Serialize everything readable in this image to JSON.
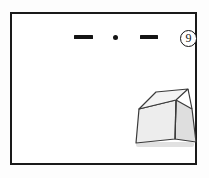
{
  "figure": {
    "domain": "scanned-line-drawing",
    "caption_number": "9",
    "badge_icon": "circled-number-icon",
    "frame": {
      "name": "drawing-border",
      "stroke_color": "#1a1a1a",
      "fill_color": "#ffffff",
      "x": 10,
      "y": 12,
      "width": 187,
      "height": 153
    },
    "background_color": "#ffffff"
  },
  "top_marks": {
    "label": "top-marking-row",
    "items": [
      {
        "name": "dash-mark-left",
        "type": "dash",
        "color": "#141414",
        "x": 62,
        "y": 21,
        "width": 19,
        "height": 4
      },
      {
        "name": "dot-mark-center",
        "type": "dot",
        "color": "#141414",
        "x": 101,
        "y": 21,
        "width": 5,
        "height": 5
      },
      {
        "name": "dash-mark-right",
        "type": "dash",
        "color": "#141414",
        "x": 128,
        "y": 21,
        "width": 18,
        "height": 4
      }
    ]
  },
  "solid": {
    "name": "frustum-truncated-pyramid",
    "description": "tapered box / truncated pyramid drawn in oblique projection",
    "outline_color": "#3a3a3a",
    "faces": [
      {
        "name": "top-face",
        "fill": "#f2f2f2",
        "shade": "lightest"
      },
      {
        "name": "front-face",
        "fill": "#ededed",
        "shade": "light"
      },
      {
        "name": "right-face",
        "fill": "#dedede",
        "shade": "mid"
      }
    ],
    "shadow_color": "#c9c9c9",
    "position": {
      "x": 118,
      "y": 72,
      "width": 74,
      "height": 68
    }
  }
}
